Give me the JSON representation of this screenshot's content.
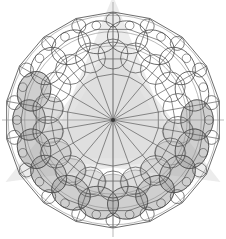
{
  "figure": {
    "type": "geometric-line-diagram",
    "width": 226,
    "height": 239,
    "background_color": "#ffffff",
    "line_color": "#4a4a4a",
    "line_color_light": "#8c8c8c",
    "fill_gray": "#a8a8a8",
    "fill_gray_light": "#c9c9c9",
    "overlay_gray": "#dcdcdc",
    "center": {
      "x": 113,
      "y": 120
    },
    "spoke_count": 18,
    "polygon_sides": 18,
    "rings": [
      {
        "name": "outer-polygon",
        "radius": 108
      },
      {
        "name": "mid-polygon",
        "radius": 92
      },
      {
        "name": "inner-polygon",
        "radius": 78
      },
      {
        "name": "core-polygon",
        "radius": 62
      },
      {
        "name": "hub-polygon",
        "radius": 46
      }
    ],
    "perimeter_circle_radius": 22,
    "perimeter_circle_ring_radius": 84,
    "inner_circle_radius": 15,
    "inner_circle_ring_radius": 60,
    "small_circle_radius": 7,
    "small_circle_ring_radius": 100,
    "shaded_sector_start_index": 4,
    "shaded_sector_end_index": 14,
    "overlay_star_points": 3,
    "overlay_star_radius": 124,
    "overlay_star_rotation": -90
  }
}
